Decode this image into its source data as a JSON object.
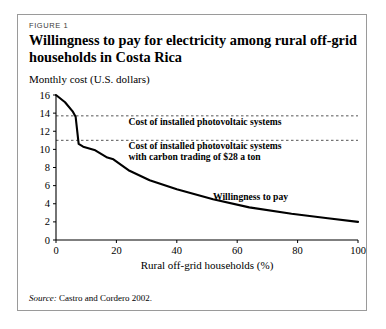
{
  "figure": {
    "label": "FIGURE 1",
    "title": "Willingness to pay for electricity among rural off-grid households in Costa Rica",
    "source_lead": "Source:",
    "source_text": " Castro and Cordero 2002."
  },
  "colors": {
    "frame": "#9a9a9a",
    "axis": "#000000",
    "series": "#000000",
    "threshold": "#555555",
    "background": "#ffffff"
  },
  "chart_data": {
    "type": "line",
    "title": "Willingness to pay for electricity among rural off-grid households in Costa Rica",
    "xlabel": "Rural off-grid households (%)",
    "ylabel": "Monthly cost (U.S. dollars)",
    "xlim": [
      0,
      100
    ],
    "ylim": [
      0,
      16
    ],
    "xticks": [
      0,
      20,
      40,
      60,
      80,
      100
    ],
    "yticks": [
      0,
      2,
      4,
      6,
      8,
      10,
      12,
      14,
      16
    ],
    "grid": false,
    "legend_position": "inline-annotation",
    "series": [
      {
        "name": "Willingness to pay",
        "label_text": "Willingness to pay",
        "label_x": 52,
        "label_y": 4.4,
        "x": [
          0,
          3,
          5.5,
          6.5,
          7.5,
          9,
          13,
          17,
          19,
          24,
          31,
          40,
          52,
          64,
          78,
          90,
          100
        ],
        "y": [
          16,
          15.2,
          14.2,
          13.6,
          10.6,
          10.3,
          9.9,
          9.1,
          8.9,
          7.7,
          6.6,
          5.6,
          4.5,
          3.6,
          2.9,
          2.4,
          2.0
        ]
      }
    ],
    "threshold_lines": [
      {
        "name": "Cost of installed photovoltaic systems",
        "value": 13.7,
        "style": "dashed",
        "annotation": "Cost of installed photovoltaic systems",
        "annotation_x": 24,
        "annotation_y": 12.7
      },
      {
        "name": "Cost of installed photovoltaic systems with carbon trading of $28 a ton",
        "value": 11.0,
        "style": "dashed",
        "annotation_line1": "Cost of installed photovoltaic systems",
        "annotation_line2": "with carbon trading of $28 a ton",
        "annotation_x": 24,
        "annotation_y": 10.0
      }
    ]
  }
}
